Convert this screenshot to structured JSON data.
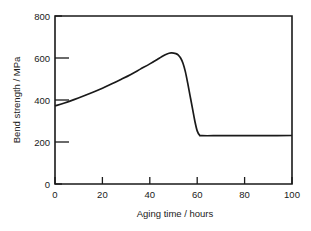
{
  "chart_data": {
    "type": "line",
    "title": "",
    "subtitle": "",
    "xlabel": "Aging time / hours",
    "ylabel": "Bend strength / MPa",
    "xlim": [
      0,
      100
    ],
    "ylim": [
      0,
      800
    ],
    "xticks": [
      0,
      20,
      40,
      60,
      80,
      100
    ],
    "yticks": [
      0,
      200,
      400,
      600,
      800
    ],
    "xtick_labels": [
      "0",
      "20",
      "40",
      "60",
      "80",
      "100"
    ],
    "ytick_labels": [
      "0",
      "200",
      "400",
      "600",
      "800"
    ],
    "grid": false,
    "legend": null,
    "legend_position": "none",
    "annotations": [],
    "series": [
      {
        "name": "Bend strength",
        "color": "#1a1a1a",
        "x": [
          0,
          4,
          8,
          12,
          16,
          20,
          24,
          28,
          32,
          36,
          40,
          43,
          45,
          47,
          49,
          51,
          52,
          53,
          54,
          55,
          56,
          57,
          58,
          59,
          60,
          61,
          62,
          70,
          80,
          90,
          100
        ],
        "y": [
          372,
          386,
          402,
          419,
          437,
          456,
          477,
          499,
          522,
          547,
          572,
          592,
          606,
          618,
          624,
          621,
          614,
          600,
          575,
          535,
          480,
          420,
          360,
          300,
          253,
          233,
          230,
          230,
          230,
          230,
          231
        ]
      }
    ]
  }
}
